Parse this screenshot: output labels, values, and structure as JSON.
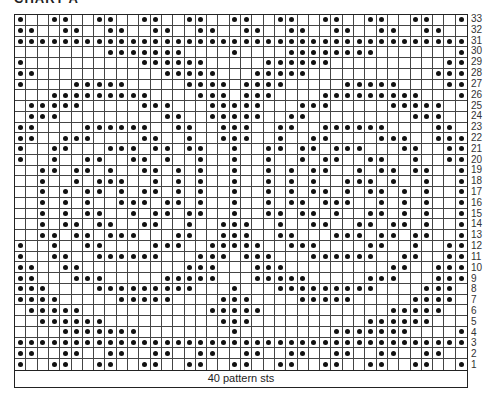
{
  "chart": {
    "title": "CHART A",
    "footer_label": "40 pattern sts",
    "columns": 40,
    "rows_count": 33,
    "dot_color": "#111111",
    "rows": [
      {
        "row": 33,
        "dots": [
          1,
          4,
          5,
          8,
          9,
          12,
          13,
          16,
          17,
          20,
          21,
          24,
          25,
          28,
          29,
          32,
          33,
          36,
          37,
          40
        ]
      },
      {
        "row": 32,
        "dots": [
          1,
          2,
          5,
          6,
          9,
          10,
          13,
          14,
          17,
          18,
          21,
          22,
          25,
          26,
          29,
          30,
          33,
          34,
          37,
          38
        ]
      },
      {
        "row": 31,
        "dots": [
          1,
          2,
          3,
          4,
          5,
          6,
          7,
          8,
          9,
          10,
          11,
          12,
          13,
          14,
          15,
          16,
          17,
          18,
          19,
          20,
          21,
          22,
          23,
          24,
          25,
          26,
          27,
          28,
          29,
          30,
          31,
          32,
          33,
          34,
          35,
          36,
          37,
          38,
          39,
          40
        ]
      },
      {
        "row": 30,
        "dots": [
          9,
          10,
          11,
          12,
          13,
          14,
          15,
          20,
          25,
          26,
          27,
          28,
          29,
          30,
          31,
          32,
          40
        ]
      },
      {
        "row": 29,
        "dots": [
          1,
          12,
          13,
          14,
          15,
          16,
          17,
          23,
          24,
          25,
          26,
          27,
          28,
          39,
          40
        ]
      },
      {
        "row": 28,
        "dots": [
          1,
          2,
          14,
          15,
          16,
          17,
          18,
          22,
          23,
          24,
          25,
          26,
          38,
          39,
          40
        ]
      },
      {
        "row": 27,
        "dots": [
          1,
          6,
          7,
          8,
          9,
          10,
          16,
          17,
          18,
          19,
          21,
          22,
          23,
          24,
          30,
          31,
          32,
          33,
          34,
          39,
          40
        ]
      },
      {
        "row": 26,
        "dots": [
          4,
          5,
          6,
          7,
          8,
          9,
          10,
          11,
          12,
          17,
          18,
          19,
          21,
          22,
          23,
          28,
          29,
          30,
          31,
          32,
          33,
          34,
          35,
          36,
          40
        ]
      },
      {
        "row": 25,
        "dots": [
          2,
          3,
          4,
          5,
          6,
          12,
          13,
          14,
          18,
          19,
          20,
          21,
          22,
          26,
          27,
          28,
          34,
          35,
          36,
          37,
          38
        ]
      },
      {
        "row": 24,
        "dots": [
          2,
          3,
          4,
          14,
          15,
          18,
          19,
          20,
          21,
          22,
          25,
          26,
          36,
          37,
          38
        ]
      },
      {
        "row": 23,
        "dots": [
          1,
          2,
          7,
          8,
          9,
          10,
          11,
          12,
          15,
          16,
          19,
          20,
          21,
          24,
          25,
          28,
          29,
          30,
          31,
          32,
          33,
          38,
          39
        ]
      },
      {
        "row": 22,
        "dots": [
          1,
          2,
          5,
          6,
          7,
          12,
          13,
          16,
          19,
          20,
          21,
          24,
          27,
          28,
          33,
          34,
          35,
          38,
          39,
          40
        ]
      },
      {
        "row": 21,
        "dots": [
          1,
          4,
          5,
          9,
          10,
          11,
          13,
          14,
          16,
          17,
          20,
          23,
          24,
          26,
          27,
          29,
          30,
          31,
          35,
          36,
          39,
          40
        ]
      },
      {
        "row": 20,
        "dots": [
          1,
          4,
          7,
          8,
          11,
          12,
          14,
          17,
          20,
          23,
          26,
          28,
          29,
          32,
          33,
          36,
          39,
          40
        ]
      },
      {
        "row": 19,
        "dots": [
          3,
          4,
          6,
          7,
          9,
          12,
          13,
          15,
          17,
          20,
          23,
          25,
          27,
          28,
          31,
          33,
          34,
          36,
          37,
          40
        ]
      },
      {
        "row": 18,
        "dots": [
          3,
          6,
          8,
          9,
          10,
          13,
          15,
          17,
          20,
          23,
          25,
          27,
          30,
          31,
          32,
          34,
          37,
          40
        ]
      },
      {
        "row": 17,
        "dots": [
          3,
          5,
          7,
          8,
          10,
          12,
          13,
          15,
          17,
          20,
          23,
          25,
          27,
          28,
          30,
          32,
          33,
          35,
          37,
          40
        ]
      },
      {
        "row": 16,
        "dots": [
          3,
          5,
          7,
          10,
          11,
          12,
          14,
          15,
          17,
          20,
          23,
          25,
          26,
          28,
          29,
          30,
          33,
          35,
          37,
          40
        ]
      },
      {
        "row": 15,
        "dots": [
          3,
          5,
          7,
          8,
          11,
          13,
          14,
          16,
          17,
          20,
          23,
          24,
          26,
          27,
          29,
          32,
          33,
          35,
          37,
          40
        ]
      },
      {
        "row": 14,
        "dots": [
          3,
          5,
          6,
          8,
          9,
          12,
          13,
          16,
          19,
          20,
          21,
          24,
          27,
          28,
          31,
          32,
          34,
          35,
          37,
          40
        ]
      },
      {
        "row": 13,
        "dots": [
          3,
          4,
          6,
          7,
          9,
          10,
          11,
          15,
          16,
          19,
          20,
          21,
          24,
          25,
          29,
          30,
          31,
          33,
          34,
          36,
          37,
          40
        ]
      },
      {
        "row": 12,
        "dots": [
          1,
          4,
          7,
          8,
          13,
          14,
          15,
          18,
          19,
          20,
          21,
          22,
          25,
          26,
          27,
          32,
          33,
          36,
          39,
          40
        ]
      },
      {
        "row": 11,
        "dots": [
          1,
          4,
          5,
          8,
          9,
          10,
          11,
          12,
          13,
          17,
          18,
          19,
          21,
          22,
          23,
          27,
          28,
          29,
          30,
          31,
          32,
          35,
          36,
          39,
          40
        ]
      },
      {
        "row": 10,
        "dots": [
          1,
          2,
          5,
          6,
          16,
          17,
          18,
          22,
          23,
          24,
          34,
          35,
          38,
          39,
          40
        ]
      },
      {
        "row": 9,
        "dots": [
          1,
          2,
          6,
          7,
          8,
          14,
          15,
          16,
          17,
          18,
          22,
          23,
          24,
          25,
          26,
          32,
          33,
          34,
          38,
          39,
          40
        ]
      },
      {
        "row": 8,
        "dots": [
          1,
          2,
          3,
          8,
          9,
          10,
          11,
          12,
          13,
          14,
          15,
          16,
          20,
          24,
          25,
          26,
          27,
          28,
          29,
          30,
          31,
          32,
          37,
          38,
          39
        ]
      },
      {
        "row": 7,
        "dots": [
          1,
          2,
          3,
          4,
          10,
          11,
          12,
          13,
          14,
          19,
          20,
          21,
          26,
          27,
          28,
          29,
          30,
          36,
          37,
          38,
          39
        ]
      },
      {
        "row": 6,
        "dots": [
          2,
          3,
          4,
          5,
          6,
          18,
          19,
          20,
          21,
          22,
          34,
          35,
          36,
          37,
          38
        ]
      },
      {
        "row": 5,
        "dots": [
          3,
          4,
          5,
          6,
          7,
          8,
          19,
          20,
          21,
          32,
          33,
          34,
          35,
          36,
          37
        ]
      },
      {
        "row": 4,
        "dots": [
          5,
          6,
          7,
          8,
          9,
          10,
          11,
          20,
          29,
          30,
          31,
          32,
          33,
          34,
          35,
          40
        ]
      },
      {
        "row": 3,
        "dots": [
          1,
          2,
          3,
          4,
          5,
          6,
          7,
          8,
          9,
          10,
          11,
          12,
          13,
          14,
          15,
          16,
          17,
          18,
          19,
          20,
          21,
          22,
          23,
          24,
          25,
          26,
          27,
          28,
          29,
          30,
          31,
          32,
          33,
          34,
          35,
          36,
          37,
          38,
          39,
          40
        ]
      },
      {
        "row": 2,
        "dots": [
          1,
          2,
          5,
          6,
          9,
          10,
          13,
          14,
          17,
          18,
          21,
          22,
          25,
          26,
          29,
          30,
          33,
          34,
          37,
          38
        ]
      },
      {
        "row": 1,
        "dots": [
          1,
          4,
          5,
          8,
          9,
          12,
          13,
          16,
          17,
          20,
          21,
          24,
          25,
          28,
          29,
          32,
          33,
          36,
          37,
          40
        ]
      }
    ]
  }
}
